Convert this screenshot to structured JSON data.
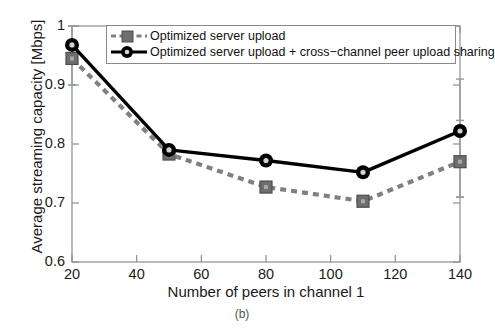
{
  "chart_data": {
    "type": "line",
    "title": "",
    "xlabel": "Number of peers in channel 1",
    "ylabel": "Average streaming capacity [Mbps]",
    "xlim": [
      20,
      140
    ],
    "ylim": [
      0.6,
      1.0
    ],
    "xticks": [
      20,
      40,
      60,
      80,
      100,
      120,
      140
    ],
    "yticks": [
      0.6,
      0.7,
      0.8,
      0.9,
      1.0
    ],
    "xtick_labels": [
      "20",
      "40",
      "60",
      "80",
      "100",
      "120",
      "140"
    ],
    "ytick_labels": [
      "0.6",
      "0.7",
      "0.8",
      "0.9",
      "1"
    ],
    "grid": false,
    "legend_position": "top-right",
    "x": [
      20,
      50,
      80,
      110,
      140
    ],
    "series": [
      {
        "name": "Optimized server upload",
        "values": [
          0.945,
          0.783,
          0.727,
          0.703,
          0.77
        ],
        "color": "#808080",
        "linestyle": "dashed",
        "marker": "square",
        "errorbars": [
          {
            "x": 20,
            "low": 0.9,
            "high": 1.0
          },
          {
            "x": 140,
            "low": 0.71,
            "high": 0.84
          }
        ]
      },
      {
        "name": "Optimized server upload + cross−channel peer upload sharing",
        "values": [
          0.968,
          0.79,
          0.772,
          0.752,
          0.822
        ],
        "color": "#000000",
        "linestyle": "solid",
        "marker": "circle",
        "errorbars": [
          {
            "x": 20,
            "low": 0.9,
            "high": 1.0
          },
          {
            "x": 140,
            "low": 0.71,
            "high": 0.91
          }
        ]
      }
    ]
  },
  "caption": "(b)",
  "colors": {
    "series_gray": "#808080",
    "series_black": "#000000",
    "axis": "#888888",
    "text": "#1a1a1a"
  }
}
